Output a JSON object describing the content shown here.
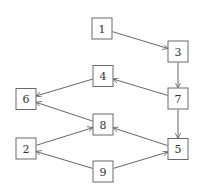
{
  "diagram": {
    "type": "directed-graph",
    "colors": {
      "stroke": "#6a6a6a",
      "edge": "#555555",
      "label": "#333333",
      "background": "#ffffff"
    },
    "nodes": [
      {
        "id": "1",
        "label": "1",
        "x": 102,
        "y": 28.5
      },
      {
        "id": "3",
        "label": "3",
        "x": 178,
        "y": 51.5
      },
      {
        "id": "4",
        "label": "4",
        "x": 103,
        "y": 76
      },
      {
        "id": "7",
        "label": "7",
        "x": 178,
        "y": 98.5
      },
      {
        "id": "6",
        "label": "6",
        "x": 26,
        "y": 99
      },
      {
        "id": "8",
        "label": "8",
        "x": 103,
        "y": 124.5
      },
      {
        "id": "2",
        "label": "2",
        "x": 26,
        "y": 148.5
      },
      {
        "id": "5",
        "label": "5",
        "x": 178,
        "y": 149
      },
      {
        "id": "9",
        "label": "9",
        "x": 103,
        "y": 171.5
      }
    ],
    "node_size": {
      "w": 20,
      "h": 21
    },
    "edges": [
      {
        "from": "1",
        "to": "3"
      },
      {
        "from": "3",
        "to": "7"
      },
      {
        "from": "7",
        "to": "4"
      },
      {
        "from": "7",
        "to": "5"
      },
      {
        "from": "4",
        "to": "6"
      },
      {
        "from": "8",
        "to": "6"
      },
      {
        "from": "5",
        "to": "8"
      },
      {
        "from": "2",
        "to": "8"
      },
      {
        "from": "9",
        "to": "2"
      },
      {
        "from": "9",
        "to": "5"
      }
    ]
  }
}
